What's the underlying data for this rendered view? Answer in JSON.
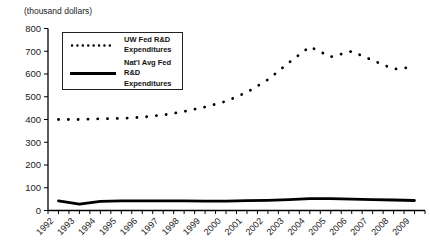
{
  "page": {
    "background": "#ffffff",
    "line_color": "#000000",
    "text_color": "#1a1a1a"
  },
  "chart_data": {
    "type": "line",
    "title": "",
    "y_axis_title": "(thousand dollars)",
    "xlabel": "",
    "ylabel": "(thousand dollars)",
    "categories": [
      "1992",
      "1993",
      "1994",
      "1995",
      "1996",
      "1997",
      "1998",
      "1999",
      "2000",
      "2001",
      "2002",
      "2003",
      "2004",
      "2005",
      "2006",
      "2007",
      "2008",
      "2009"
    ],
    "series": [
      {
        "name": "UW Fed R&D Expenditures",
        "style": "dotted",
        "color": "#000000",
        "values": [
          400,
          400,
          403,
          405,
          410,
          420,
          435,
          455,
          480,
          520,
          575,
          650,
          720,
          675,
          700,
          660,
          622,
          630
        ]
      },
      {
        "name": "Nat'l Avg Fed R&D Expenditures",
        "style": "solid",
        "color": "#000000",
        "values": [
          42,
          28,
          40,
          42,
          42,
          42,
          42,
          41,
          41,
          43,
          45,
          48,
          52,
          52,
          50,
          48,
          46,
          44
        ]
      }
    ],
    "ylim": [
      0,
      800
    ],
    "y_ticks": [
      0,
      100,
      200,
      300,
      400,
      500,
      600,
      700,
      800
    ],
    "grid": "off",
    "legend_position": "top-left-inside",
    "x_tick_style": "minor ticks at half-year intervals, year labels rotated 45deg"
  }
}
